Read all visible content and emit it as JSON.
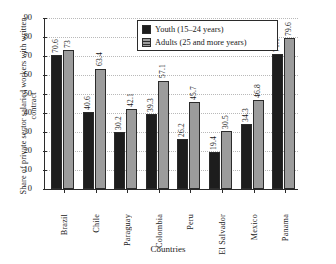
{
  "top_fragment": "",
  "chart_data": {
    "type": "bar",
    "title": "",
    "xlabel": "Countries",
    "ylabel": "Share of private sector salaried workers with written contract",
    "ylim": [
      0,
      90
    ],
    "yticks": [
      0,
      10,
      20,
      30,
      40,
      50,
      60,
      70,
      80,
      90
    ],
    "grid": true,
    "legend_position": "top-center",
    "categories": [
      "Brazil",
      "Chile",
      "Paraguay",
      "Colombia",
      "Peru",
      "El Salvador",
      "Mexico",
      "Panama"
    ],
    "series": [
      {
        "name": "Youth (15–24 years)",
        "color": "#1d1d1d",
        "values": [
          70.6,
          40.6,
          30.2,
          39.3,
          26.2,
          19.4,
          34.3,
          71.1
        ],
        "labels": [
          "70.6",
          "40.6",
          "30.2",
          "39.3",
          "26.2",
          "19.4",
          "34.3",
          "71.1"
        ]
      },
      {
        "name": "Adults (25 and more years)",
        "color": "#9c9c9c",
        "values": [
          73,
          63.4,
          42.1,
          57.1,
          45.7,
          30.5,
          46.8,
          79.6
        ],
        "labels": [
          "73",
          "63.4",
          "42.1",
          "57.1",
          "45.7",
          "30.5",
          "46.8",
          "79.6"
        ]
      }
    ]
  }
}
